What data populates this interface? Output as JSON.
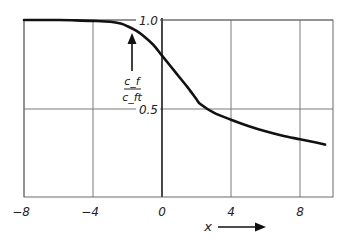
{
  "chart_data": {
    "type": "line",
    "title": "",
    "xlabel": "x",
    "ylabel_numerator": "c_f",
    "ylabel_denominator": "c_ft",
    "ylabel": "c_f / c_ft",
    "xlim": [
      -8,
      9.5
    ],
    "ylim": [
      0,
      1.0
    ],
    "x_ticks": [
      -8,
      -4,
      0,
      4,
      8
    ],
    "x_tick_labels": [
      "−8",
      "−4",
      "0",
      "4",
      "8"
    ],
    "y_ticks": [
      0.5,
      1.0
    ],
    "y_tick_labels": [
      "0.5",
      "1.0"
    ],
    "grid": true,
    "legend": "none",
    "series": [
      {
        "name": "c_f / c_ft",
        "x": [
          -8,
          -6,
          -5,
          -4,
          -3,
          -2.4,
          -2,
          -1.5,
          -1,
          -0.5,
          0,
          0.5,
          1,
          1.5,
          2,
          2.2,
          3,
          4,
          5,
          6,
          7,
          8,
          9,
          9.45
        ],
        "y": [
          1.0,
          1.0,
          0.998,
          0.995,
          0.99,
          0.98,
          0.965,
          0.94,
          0.905,
          0.86,
          0.8,
          0.74,
          0.68,
          0.62,
          0.555,
          0.53,
          0.48,
          0.44,
          0.405,
          0.375,
          0.35,
          0.33,
          0.31,
          0.3
        ]
      }
    ],
    "color": "#111111"
  }
}
